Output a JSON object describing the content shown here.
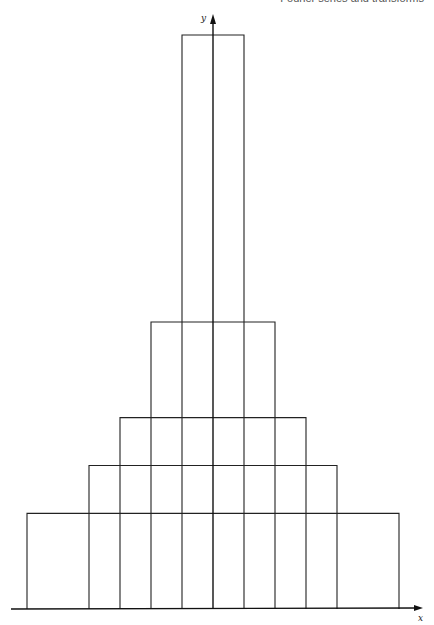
{
  "header": {
    "running_title": "Fourier series and transforms"
  },
  "chart_data": {
    "type": "line",
    "title": "",
    "xlabel": "x",
    "ylabel": "y",
    "grid": false,
    "legend": "none",
    "xlim": [
      -6.5,
      7
    ],
    "ylim": [
      0,
      0.53
    ],
    "series": [
      {
        "name": "pulse a=1",
        "half_width": 1,
        "height": 0.5
      },
      {
        "name": "pulse a=2",
        "half_width": 2,
        "height": 0.25
      },
      {
        "name": "pulse a=3",
        "half_width": 3,
        "height": 0.1667
      },
      {
        "name": "pulse a=4",
        "half_width": 4,
        "height": 0.125
      },
      {
        "name": "pulse a=6",
        "half_width": 6,
        "height": 0.0833
      }
    ]
  }
}
